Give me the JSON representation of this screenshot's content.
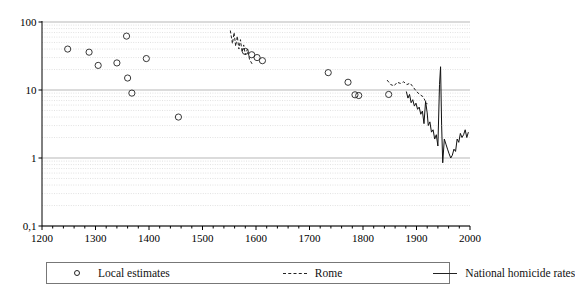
{
  "chart_data": {
    "type": "scatter",
    "title": "",
    "xlabel": "",
    "ylabel": "",
    "yscale": "log",
    "xlim": [
      1200,
      2000
    ],
    "ylim": [
      0.1,
      100
    ],
    "grid": true,
    "legend_position": "bottom",
    "x_ticks": [
      1200,
      1300,
      1400,
      1500,
      1600,
      1700,
      1800,
      1900,
      2000
    ],
    "x_tick_labels": [
      "1200",
      "1300",
      "1400",
      "1500",
      "1600",
      "1700",
      "1800",
      "1900",
      "2000"
    ],
    "y_ticks": [
      0.1,
      1,
      10,
      100
    ],
    "y_tick_labels": [
      "0,1",
      "1",
      "10",
      "100"
    ],
    "series": [
      {
        "name": "Local estimates",
        "type": "scatter",
        "marker": "open-circle",
        "color": "#222222",
        "points": [
          {
            "x": 1248,
            "y": 40
          },
          {
            "x": 1288,
            "y": 36
          },
          {
            "x": 1305,
            "y": 23
          },
          {
            "x": 1340,
            "y": 25
          },
          {
            "x": 1358,
            "y": 62
          },
          {
            "x": 1360,
            "y": 15
          },
          {
            "x": 1368,
            "y": 9.0
          },
          {
            "x": 1395,
            "y": 29
          },
          {
            "x": 1455,
            "y": 4.0
          },
          {
            "x": 1580,
            "y": 37
          },
          {
            "x": 1592,
            "y": 33
          },
          {
            "x": 1602,
            "y": 30
          },
          {
            "x": 1612,
            "y": 27
          },
          {
            "x": 1735,
            "y": 18
          },
          {
            "x": 1772,
            "y": 13
          },
          {
            "x": 1785,
            "y": 8.5
          },
          {
            "x": 1792,
            "y": 8.3
          },
          {
            "x": 1848,
            "y": 8.6
          }
        ]
      },
      {
        "name": "Rome",
        "type": "line",
        "style": "dashed",
        "color": "#222222",
        "segments": [
          {
            "label": "Rome 16th century",
            "points": [
              {
                "x": 1552,
                "y": 75
              },
              {
                "x": 1556,
                "y": 48
              },
              {
                "x": 1559,
                "y": 70
              },
              {
                "x": 1562,
                "y": 44
              },
              {
                "x": 1565,
                "y": 62
              },
              {
                "x": 1568,
                "y": 40
              },
              {
                "x": 1571,
                "y": 55
              },
              {
                "x": 1574,
                "y": 36
              },
              {
                "x": 1577,
                "y": 46
              },
              {
                "x": 1580,
                "y": 33
              },
              {
                "x": 1584,
                "y": 40
              },
              {
                "x": 1588,
                "y": 28
              },
              {
                "x": 1593,
                "y": 24
              }
            ]
          },
          {
            "label": "Rome 19th-20th century",
            "points": [
              {
                "x": 1845,
                "y": 14
              },
              {
                "x": 1852,
                "y": 12
              },
              {
                "x": 1858,
                "y": 11.5
              },
              {
                "x": 1864,
                "y": 13
              },
              {
                "x": 1870,
                "y": 12.5
              },
              {
                "x": 1876,
                "y": 13.2
              },
              {
                "x": 1882,
                "y": 12
              },
              {
                "x": 1888,
                "y": 12.6
              },
              {
                "x": 1894,
                "y": 11
              },
              {
                "x": 1900,
                "y": 9.5
              },
              {
                "x": 1906,
                "y": 8.6
              },
              {
                "x": 1912,
                "y": 8.0
              },
              {
                "x": 1916,
                "y": 7.0
              },
              {
                "x": 1920,
                "y": 6.2
              }
            ]
          }
        ]
      },
      {
        "name": "National homicide rates",
        "type": "line",
        "style": "solid",
        "color": "#111111",
        "points": [
          {
            "x": 1881,
            "y": 9.5
          },
          {
            "x": 1884,
            "y": 7.6
          },
          {
            "x": 1887,
            "y": 8.6
          },
          {
            "x": 1890,
            "y": 6.5
          },
          {
            "x": 1893,
            "y": 7.2
          },
          {
            "x": 1896,
            "y": 5.8
          },
          {
            "x": 1899,
            "y": 6.4
          },
          {
            "x": 1902,
            "y": 5.2
          },
          {
            "x": 1905,
            "y": 5.6
          },
          {
            "x": 1908,
            "y": 4.4
          },
          {
            "x": 1911,
            "y": 4.9
          },
          {
            "x": 1914,
            "y": 3.2
          },
          {
            "x": 1917,
            "y": 6.8
          },
          {
            "x": 1920,
            "y": 4.6
          },
          {
            "x": 1922,
            "y": 3.0
          },
          {
            "x": 1925,
            "y": 3.4
          },
          {
            "x": 1928,
            "y": 2.4
          },
          {
            "x": 1931,
            "y": 2.6
          },
          {
            "x": 1934,
            "y": 1.9
          },
          {
            "x": 1937,
            "y": 2.2
          },
          {
            "x": 1940,
            "y": 1.5
          },
          {
            "x": 1943,
            "y": 12.0
          },
          {
            "x": 1945,
            "y": 22.0
          },
          {
            "x": 1947,
            "y": 3.0
          },
          {
            "x": 1949,
            "y": 0.85
          },
          {
            "x": 1952,
            "y": 1.9
          },
          {
            "x": 1955,
            "y": 1.6
          },
          {
            "x": 1958,
            "y": 1.35
          },
          {
            "x": 1961,
            "y": 1.15
          },
          {
            "x": 1964,
            "y": 1.0
          },
          {
            "x": 1967,
            "y": 1.1
          },
          {
            "x": 1970,
            "y": 1.35
          },
          {
            "x": 1973,
            "y": 1.25
          },
          {
            "x": 1976,
            "y": 1.9
          },
          {
            "x": 1979,
            "y": 1.7
          },
          {
            "x": 1982,
            "y": 2.3
          },
          {
            "x": 1985,
            "y": 2.0
          },
          {
            "x": 1988,
            "y": 2.2
          },
          {
            "x": 1991,
            "y": 2.6
          },
          {
            "x": 1994,
            "y": 2.0
          },
          {
            "x": 1997,
            "y": 2.4
          }
        ]
      }
    ]
  },
  "legend": {
    "items": [
      {
        "label": "Local estimates",
        "symbol": "open-circle"
      },
      {
        "label": "Rome",
        "symbol": "dashed-line"
      },
      {
        "label": "National homicide rates",
        "symbol": "solid-line"
      }
    ]
  }
}
